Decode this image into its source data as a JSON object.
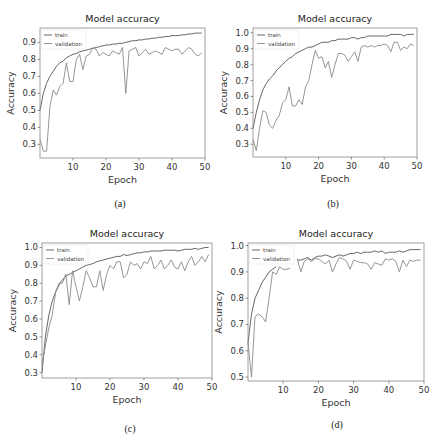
{
  "chart_data": [
    {
      "id": "a",
      "type": "line",
      "title": "Model accuracy",
      "xlabel": "Epoch",
      "ylabel": "Accuracy",
      "caption": "(a)",
      "xlim": [
        0,
        50
      ],
      "ylim": [
        0.22,
        0.985
      ],
      "xticks": [
        10,
        20,
        30,
        40,
        50
      ],
      "yticks": [
        0.3,
        0.4,
        0.5,
        0.6,
        0.7,
        0.8,
        0.9
      ],
      "ytick_labels": [
        "0.3",
        "0.4",
        "0.5",
        "0.6",
        "0.7",
        "0.8",
        "0.9"
      ],
      "legend": [
        "train",
        "validation"
      ],
      "legend_position": "upper left",
      "grid": false,
      "x": [
        0,
        1,
        2,
        3,
        4,
        5,
        6,
        7,
        8,
        9,
        10,
        11,
        12,
        13,
        14,
        15,
        16,
        17,
        18,
        19,
        20,
        21,
        22,
        23,
        24,
        25,
        26,
        27,
        28,
        29,
        30,
        31,
        32,
        33,
        34,
        35,
        36,
        37,
        38,
        39,
        40,
        41,
        42,
        43,
        44,
        45,
        46,
        47,
        48,
        49
      ],
      "series": [
        {
          "name": "train",
          "values": [
            0.5,
            0.6,
            0.66,
            0.7,
            0.73,
            0.76,
            0.78,
            0.79,
            0.81,
            0.82,
            0.83,
            0.835,
            0.845,
            0.85,
            0.855,
            0.86,
            0.865,
            0.87,
            0.875,
            0.88,
            0.885,
            0.885,
            0.89,
            0.89,
            0.895,
            0.895,
            0.9,
            0.905,
            0.91,
            0.91,
            0.915,
            0.915,
            0.92,
            0.92,
            0.925,
            0.925,
            0.93,
            0.93,
            0.935,
            0.935,
            0.94,
            0.94,
            0.94,
            0.945,
            0.945,
            0.95,
            0.95,
            0.955,
            0.955,
            0.955
          ]
        },
        {
          "name": "validation",
          "values": [
            0.33,
            0.26,
            0.26,
            0.52,
            0.62,
            0.59,
            0.64,
            0.66,
            0.78,
            0.67,
            0.67,
            0.8,
            0.83,
            0.74,
            0.82,
            0.83,
            0.87,
            0.86,
            0.82,
            0.84,
            0.83,
            0.82,
            0.85,
            0.84,
            0.83,
            0.87,
            0.6,
            0.85,
            0.86,
            0.87,
            0.82,
            0.84,
            0.86,
            0.83,
            0.84,
            0.85,
            0.84,
            0.83,
            0.87,
            0.86,
            0.85,
            0.86,
            0.86,
            0.83,
            0.85,
            0.87,
            0.86,
            0.83,
            0.82,
            0.84
          ]
        }
      ]
    },
    {
      "id": "b",
      "type": "line",
      "title": "Model accuracy",
      "xlabel": "Epoch",
      "ylabel": "Accuracy",
      "caption": "(b)",
      "xlim": [
        0,
        50
      ],
      "ylim": [
        0.22,
        1.03
      ],
      "xticks": [
        10,
        20,
        30,
        40,
        50
      ],
      "yticks": [
        0.3,
        0.4,
        0.5,
        0.6,
        0.7,
        0.8,
        0.9,
        1.0
      ],
      "ytick_labels": [
        "0.3",
        "0.4",
        "0.5",
        "0.6",
        "0.7",
        "0.8",
        "0.9",
        "1.0"
      ],
      "legend": [
        "train",
        "validation"
      ],
      "legend_position": "upper left",
      "grid": false,
      "x": [
        0,
        1,
        2,
        3,
        4,
        5,
        6,
        7,
        8,
        9,
        10,
        11,
        12,
        13,
        14,
        15,
        16,
        17,
        18,
        19,
        20,
        21,
        22,
        23,
        24,
        25,
        26,
        27,
        28,
        29,
        30,
        31,
        32,
        33,
        34,
        35,
        36,
        37,
        38,
        39,
        40,
        41,
        42,
        43,
        44,
        45,
        46,
        47,
        48,
        49
      ],
      "series": [
        {
          "name": "train",
          "values": [
            0.4,
            0.5,
            0.58,
            0.64,
            0.68,
            0.71,
            0.73,
            0.76,
            0.78,
            0.8,
            0.82,
            0.84,
            0.85,
            0.87,
            0.88,
            0.89,
            0.9,
            0.91,
            0.91,
            0.92,
            0.93,
            0.94,
            0.94,
            0.94,
            0.95,
            0.95,
            0.96,
            0.96,
            0.96,
            0.96,
            0.97,
            0.97,
            0.96,
            0.97,
            0.97,
            0.98,
            0.98,
            0.98,
            0.98,
            0.98,
            0.98,
            0.98,
            0.99,
            0.99,
            0.99,
            0.99,
            0.98,
            0.99,
            0.99,
            0.99
          ]
        },
        {
          "name": "validation",
          "values": [
            0.33,
            0.26,
            0.4,
            0.51,
            0.5,
            0.42,
            0.4,
            0.45,
            0.48,
            0.56,
            0.58,
            0.66,
            0.54,
            0.54,
            0.58,
            0.55,
            0.66,
            0.7,
            0.8,
            0.89,
            0.84,
            0.85,
            0.78,
            0.82,
            0.72,
            0.8,
            0.87,
            0.87,
            0.86,
            0.82,
            0.85,
            0.88,
            0.82,
            0.91,
            0.92,
            0.91,
            0.92,
            0.91,
            0.92,
            0.92,
            0.93,
            0.92,
            0.88,
            0.94,
            0.94,
            0.89,
            0.91,
            0.9,
            0.93,
            0.92
          ]
        }
      ]
    },
    {
      "id": "c",
      "type": "line",
      "title": "Model accuracy",
      "xlabel": "Epoch",
      "ylabel": "Accuracy",
      "caption": "(c)",
      "xlim": [
        0,
        50
      ],
      "ylim": [
        0.27,
        1.025
      ],
      "xticks": [
        10,
        20,
        30,
        40,
        50
      ],
      "yticks": [
        0.3,
        0.4,
        0.5,
        0.6,
        0.7,
        0.8,
        0.9,
        1.0
      ],
      "ytick_labels": [
        "0.3",
        "0.4",
        "0.5",
        "0.6",
        "0.7",
        "0.8",
        "0.9",
        "1.0"
      ],
      "legend": [
        "train",
        "validation"
      ],
      "legend_position": "upper left",
      "grid": false,
      "x": [
        0,
        1,
        2,
        3,
        4,
        5,
        6,
        7,
        8,
        9,
        10,
        11,
        12,
        13,
        14,
        15,
        16,
        17,
        18,
        19,
        20,
        21,
        22,
        23,
        24,
        25,
        26,
        27,
        28,
        29,
        30,
        31,
        32,
        33,
        34,
        35,
        36,
        37,
        38,
        39,
        40,
        41,
        42,
        43,
        44,
        45,
        46,
        47,
        48,
        49
      ],
      "series": [
        {
          "name": "train",
          "values": [
            0.3,
            0.5,
            0.62,
            0.7,
            0.75,
            0.79,
            0.82,
            0.84,
            0.85,
            0.86,
            0.87,
            0.88,
            0.89,
            0.9,
            0.905,
            0.91,
            0.92,
            0.925,
            0.93,
            0.935,
            0.94,
            0.945,
            0.95,
            0.95,
            0.96,
            0.955,
            0.96,
            0.965,
            0.97,
            0.97,
            0.975,
            0.975,
            0.98,
            0.98,
            0.98,
            0.98,
            0.985,
            0.985,
            0.985,
            0.985,
            0.98,
            0.985,
            0.99,
            0.99,
            0.99,
            0.995,
            0.99,
            0.995,
            1.0,
            1.0
          ]
        },
        {
          "name": "validation",
          "values": [
            0.35,
            0.45,
            0.55,
            0.62,
            0.75,
            0.8,
            0.8,
            0.85,
            0.68,
            0.87,
            0.78,
            0.7,
            0.78,
            0.87,
            0.83,
            0.78,
            0.78,
            0.87,
            0.76,
            0.85,
            0.9,
            0.88,
            0.92,
            0.92,
            0.83,
            0.85,
            0.92,
            0.9,
            0.91,
            0.88,
            0.92,
            0.91,
            0.95,
            0.88,
            0.9,
            0.93,
            0.88,
            0.9,
            0.93,
            0.89,
            0.88,
            0.92,
            0.87,
            0.92,
            0.95,
            0.9,
            0.92,
            0.95,
            0.92,
            0.96
          ]
        }
      ]
    },
    {
      "id": "d",
      "type": "line",
      "title": "Model accuracy",
      "xlabel": "Epoch",
      "ylabel": "Accuracy",
      "caption": "(d)",
      "xlim": [
        0,
        50
      ],
      "ylim": [
        0.485,
        1.01
      ],
      "xticks": [
        10,
        20,
        30,
        40,
        50
      ],
      "yticks": [
        0.5,
        0.6,
        0.7,
        0.8,
        0.9,
        1.0
      ],
      "ytick_labels": [
        "0.5",
        "0.6",
        "0.7",
        "0.8",
        "0.9",
        "1.0"
      ],
      "legend": [
        "train",
        "validation"
      ],
      "legend_position": "upper left",
      "grid": false,
      "x": [
        0,
        1,
        2,
        3,
        4,
        5,
        6,
        7,
        8,
        9,
        10,
        11,
        12,
        13,
        14,
        15,
        16,
        17,
        18,
        19,
        20,
        21,
        22,
        23,
        24,
        25,
        26,
        27,
        28,
        29,
        30,
        31,
        32,
        33,
        34,
        35,
        36,
        37,
        38,
        39,
        40,
        41,
        42,
        43,
        44,
        45,
        46,
        47,
        48,
        49
      ],
      "series": [
        {
          "name": "train",
          "values": [
            0.63,
            0.74,
            0.8,
            0.83,
            0.86,
            0.88,
            0.9,
            0.91,
            0.92,
            null,
            null,
            null,
            null,
            null,
            0.945,
            0.945,
            0.95,
            0.955,
            0.945,
            0.955,
            0.96,
            0.96,
            0.965,
            0.96,
            0.955,
            0.96,
            0.965,
            0.96,
            0.965,
            0.97,
            0.97,
            0.975,
            0.97,
            0.975,
            0.975,
            0.975,
            0.98,
            0.975,
            0.98,
            0.97,
            0.975,
            0.975,
            0.975,
            0.98,
            0.975,
            0.98,
            0.985,
            0.985,
            0.985,
            0.985
          ]
        },
        {
          "name": "validation",
          "values": [
            0.63,
            0.5,
            0.73,
            0.74,
            0.73,
            0.71,
            0.8,
            0.9,
            0.89,
            0.92,
            0.91,
            0.91,
            0.915,
            null,
            0.95,
            0.9,
            0.94,
            0.95,
            0.94,
            0.95,
            0.95,
            0.94,
            0.93,
            0.945,
            0.9,
            0.93,
            0.955,
            0.95,
            0.94,
            0.91,
            0.945,
            0.94,
            0.935,
            0.935,
            0.93,
            0.91,
            0.935,
            0.93,
            0.925,
            0.95,
            0.945,
            0.95,
            0.94,
            0.9,
            0.945,
            0.92,
            0.945,
            0.94,
            0.945,
            0.945
          ]
        }
      ]
    }
  ],
  "panels": [
    {
      "caption": "(a)"
    },
    {
      "caption": "(b)"
    },
    {
      "caption": "(c)"
    },
    {
      "caption": "(d)"
    }
  ]
}
